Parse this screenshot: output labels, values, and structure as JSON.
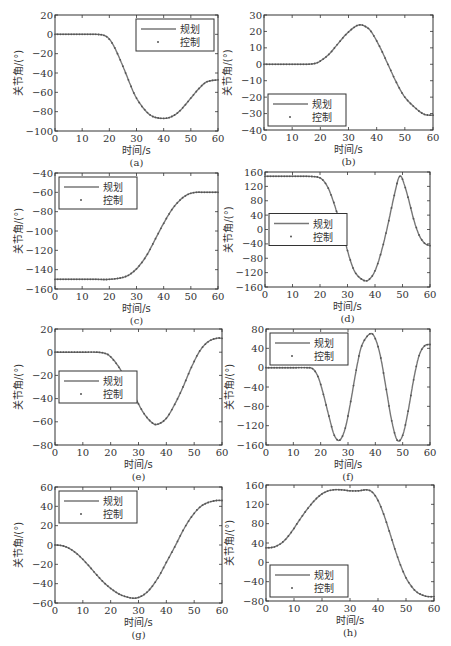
{
  "labels": {
    "xlabel": "时间/s",
    "ylabel": "关节角/(°)",
    "legend_plan": "规划",
    "legend_control": "控制"
  },
  "colors": {
    "line": "#777777",
    "marker": "#555555",
    "axes": "#333333"
  },
  "chart_data": [
    {
      "id": "a",
      "caption": "(a)",
      "type": "line",
      "xlabel": "时间/s",
      "ylabel": "关节角/(°)",
      "xlim": [
        0,
        60
      ],
      "ylim": [
        -100,
        20
      ],
      "xticks": [
        0,
        10,
        20,
        30,
        40,
        50,
        60
      ],
      "yticks": [
        -100,
        -80,
        -60,
        -40,
        -20,
        0,
        20
      ],
      "legend_position": "upper right",
      "box": [
        55,
        15,
        218,
        131
      ],
      "x": [
        0,
        5,
        10,
        15,
        18,
        20,
        22,
        25,
        28,
        30,
        33,
        36,
        40,
        43,
        46,
        50,
        53,
        56,
        60
      ],
      "series": [
        {
          "name": "规划",
          "style": "line",
          "values": [
            0,
            0,
            0,
            0,
            -1,
            -5,
            -14,
            -33,
            -54,
            -66,
            -78,
            -85,
            -87,
            -85,
            -79,
            -66,
            -56,
            -49,
            -47
          ]
        },
        {
          "name": "控制",
          "style": "dots",
          "values": [
            0,
            0,
            0,
            0,
            -1,
            -5,
            -14,
            -33,
            -54,
            -66,
            -78,
            -85,
            -87,
            -85,
            -79,
            -66,
            -56,
            -49,
            -47
          ]
        }
      ]
    },
    {
      "id": "b",
      "caption": "(b)",
      "type": "line",
      "xlabel": "时间/s",
      "ylabel": "关节角/(°)",
      "xlim": [
        0,
        60
      ],
      "ylim": [
        -40,
        30
      ],
      "xticks": [
        0,
        10,
        20,
        30,
        40,
        50,
        60
      ],
      "yticks": [
        -40,
        -30,
        -20,
        -10,
        0,
        10,
        20,
        30
      ],
      "legend_position": "lower left",
      "box": [
        264,
        15,
        433,
        130
      ],
      "x": [
        0,
        5,
        10,
        15,
        18,
        20,
        23,
        26,
        29,
        32,
        34,
        36,
        38,
        41,
        44,
        47,
        50,
        54,
        57,
        60
      ],
      "series": [
        {
          "name": "规划",
          "style": "line",
          "values": [
            0,
            0,
            0,
            0,
            0.5,
            2,
            6,
            12,
            18,
            22.5,
            24,
            23,
            20,
            11,
            0,
            -11,
            -20,
            -27,
            -30.5,
            -31
          ]
        },
        {
          "name": "控制",
          "style": "dots",
          "values": [
            0,
            0,
            0,
            0,
            0.5,
            2,
            6,
            12,
            18,
            22.5,
            24,
            23,
            20,
            11,
            0,
            -11,
            -20,
            -27,
            -30.5,
            -31
          ]
        }
      ]
    },
    {
      "id": "c",
      "caption": "(c)",
      "type": "line",
      "xlabel": "时间/s",
      "ylabel": "关节角/(°)",
      "xlim": [
        0,
        60
      ],
      "ylim": [
        -160,
        -40
      ],
      "xticks": [
        0,
        10,
        20,
        30,
        40,
        50,
        60
      ],
      "yticks": [
        -160,
        -140,
        -120,
        -100,
        -80,
        -60,
        -40
      ],
      "legend_position": "upper left",
      "box": [
        55,
        173,
        218,
        289
      ],
      "x": [
        0,
        5,
        10,
        15,
        20,
        25,
        28,
        31,
        34,
        37,
        40,
        43,
        46,
        49,
        52,
        55,
        60
      ],
      "series": [
        {
          "name": "规划",
          "style": "line",
          "values": [
            -150,
            -150,
            -150,
            -150,
            -150,
            -148,
            -144,
            -136,
            -124,
            -108,
            -92,
            -78,
            -68,
            -62,
            -60,
            -60,
            -60
          ]
        },
        {
          "name": "控制",
          "style": "dots",
          "values": [
            -150,
            -150,
            -150,
            -150,
            -150,
            -148,
            -144,
            -136,
            -124,
            -108,
            -92,
            -78,
            -68,
            -62,
            -60,
            -60,
            -60
          ]
        }
      ]
    },
    {
      "id": "d",
      "caption": "(d)",
      "type": "line",
      "xlabel": "时间/s",
      "ylabel": "关节角/(°)",
      "xlim": [
        0,
        60
      ],
      "ylim": [
        -160,
        160
      ],
      "xticks": [
        0,
        10,
        20,
        30,
        40,
        50,
        60
      ],
      "yticks": [
        -160,
        -120,
        -80,
        -40,
        0,
        40,
        80,
        120,
        160
      ],
      "legend_position": "center left",
      "box": [
        265,
        172,
        430,
        287
      ],
      "x": [
        0,
        5,
        10,
        15,
        19,
        21,
        23,
        25,
        27,
        29,
        31,
        33,
        36,
        38,
        40,
        42,
        44,
        46,
        48,
        49,
        50,
        52,
        54,
        56,
        58,
        60
      ],
      "series": [
        {
          "name": "规划",
          "style": "line",
          "values": [
            148,
            148,
            148,
            148,
            146,
            138,
            115,
            75,
            25,
            -30,
            -85,
            -122,
            -142,
            -138,
            -115,
            -70,
            -10,
            60,
            128,
            148,
            140,
            90,
            30,
            -15,
            -38,
            -45
          ]
        },
        {
          "name": "控制",
          "style": "dots",
          "values": [
            148,
            148,
            148,
            148,
            146,
            138,
            115,
            75,
            25,
            -30,
            -85,
            -122,
            -142,
            -138,
            -115,
            -70,
            -10,
            60,
            128,
            148,
            140,
            90,
            30,
            -15,
            -38,
            -45
          ]
        }
      ]
    },
    {
      "id": "e",
      "caption": "(e)",
      "type": "line",
      "xlabel": "时间/s",
      "ylabel": "关节角/(°)",
      "xlim": [
        0,
        60
      ],
      "ylim": [
        -80,
        20
      ],
      "xticks": [
        0,
        10,
        20,
        30,
        40,
        50,
        60
      ],
      "yticks": [
        -80,
        -60,
        -40,
        -20,
        0,
        20
      ],
      "legend_position": "center left",
      "box": [
        55,
        329,
        222,
        445
      ],
      "x": [
        0,
        5,
        10,
        15,
        18,
        20,
        23,
        26,
        29,
        32,
        35,
        37,
        40,
        43,
        46,
        49,
        52,
        55,
        58,
        60
      ],
      "series": [
        {
          "name": "规划",
          "style": "line",
          "values": [
            0,
            0,
            0,
            0,
            -1,
            -4,
            -13,
            -26,
            -40,
            -53,
            -61,
            -62,
            -57,
            -45,
            -30,
            -13,
            1,
            9,
            12,
            12
          ]
        },
        {
          "name": "控制",
          "style": "dots",
          "values": [
            0,
            0,
            0,
            0,
            -1,
            -4,
            -13,
            -26,
            -40,
            -53,
            -61,
            -62,
            -57,
            -45,
            -30,
            -13,
            1,
            9,
            12,
            12
          ]
        }
      ]
    },
    {
      "id": "f",
      "caption": "(f)",
      "type": "line",
      "xlabel": "时间/s",
      "ylabel": "关节角/(°)",
      "xlim": [
        0,
        60
      ],
      "ylim": [
        -160,
        80
      ],
      "xticks": [
        0,
        10,
        20,
        30,
        40,
        50,
        60
      ],
      "yticks": [
        -160,
        -120,
        -80,
        -40,
        0,
        40,
        80
      ],
      "legend_position": "upper left",
      "box": [
        266,
        329,
        430,
        445
      ],
      "x": [
        0,
        5,
        10,
        15,
        17,
        19,
        21,
        23,
        25,
        27,
        29,
        31,
        33,
        35,
        38,
        40,
        42,
        44,
        46,
        48,
        50,
        52,
        54,
        56,
        58,
        60
      ],
      "series": [
        {
          "name": "规划",
          "style": "line",
          "values": [
            0,
            0,
            0,
            0,
            -2,
            -18,
            -55,
            -100,
            -140,
            -150,
            -125,
            -70,
            -5,
            45,
            70,
            60,
            20,
            -45,
            -110,
            -150,
            -140,
            -90,
            -25,
            25,
            45,
            48
          ]
        },
        {
          "name": "控制",
          "style": "dots",
          "values": [
            0,
            0,
            0,
            0,
            -2,
            -18,
            -55,
            -100,
            -140,
            -150,
            -125,
            -70,
            -5,
            45,
            70,
            60,
            20,
            -45,
            -110,
            -150,
            -140,
            -90,
            -25,
            25,
            45,
            48
          ]
        }
      ]
    },
    {
      "id": "g",
      "caption": "(g)",
      "type": "line",
      "xlabel": "时间/s",
      "ylabel": "关节角/(°)",
      "xlim": [
        0,
        60
      ],
      "ylim": [
        -60,
        60
      ],
      "xticks": [
        0,
        10,
        20,
        30,
        40,
        50,
        60
      ],
      "yticks": [
        -60,
        -40,
        -20,
        0,
        20,
        40,
        60
      ],
      "legend_position": "upper left",
      "box": [
        55,
        487,
        222,
        603
      ],
      "x": [
        0,
        3,
        6,
        9,
        12,
        15,
        18,
        21,
        24,
        28,
        31,
        34,
        37,
        40,
        43,
        46,
        49,
        52,
        55,
        58,
        60
      ],
      "series": [
        {
          "name": "规划",
          "style": "line",
          "values": [
            0,
            -1,
            -5,
            -12,
            -21,
            -31,
            -40,
            -47,
            -52,
            -55,
            -53,
            -46,
            -34,
            -18,
            -2,
            15,
            29,
            39,
            44,
            46,
            46
          ]
        },
        {
          "name": "控制",
          "style": "dots",
          "values": [
            0,
            -1,
            -5,
            -12,
            -21,
            -31,
            -40,
            -47,
            -52,
            -55,
            -53,
            -46,
            -34,
            -18,
            -2,
            15,
            29,
            39,
            44,
            46,
            46
          ]
        }
      ]
    },
    {
      "id": "h",
      "caption": "(h)",
      "type": "line",
      "xlabel": "时间/s",
      "ylabel": "关节角/(°)",
      "xlim": [
        0,
        60
      ],
      "ylim": [
        -80,
        160
      ],
      "xticks": [
        0,
        10,
        20,
        30,
        40,
        50,
        60
      ],
      "yticks": [
        -80,
        -40,
        0,
        40,
        80,
        120,
        160
      ],
      "legend_position": "lower left",
      "box": [
        266,
        485,
        434,
        601
      ],
      "x": [
        0,
        3,
        6,
        9,
        12,
        15,
        18,
        21,
        24,
        27,
        30,
        33,
        36,
        38,
        40,
        42,
        44,
        46,
        48,
        50,
        52,
        54,
        57,
        60
      ],
      "series": [
        {
          "name": "规划",
          "style": "line",
          "values": [
            30,
            32,
            42,
            62,
            88,
            112,
            132,
            145,
            150,
            150,
            148,
            148,
            150,
            145,
            128,
            100,
            65,
            28,
            -5,
            -32,
            -50,
            -62,
            -70,
            -71
          ]
        },
        {
          "name": "控制",
          "style": "dots",
          "values": [
            30,
            32,
            42,
            62,
            88,
            112,
            132,
            145,
            150,
            150,
            148,
            148,
            150,
            145,
            128,
            100,
            65,
            28,
            -5,
            -32,
            -50,
            -62,
            -70,
            -71
          ]
        }
      ]
    }
  ]
}
